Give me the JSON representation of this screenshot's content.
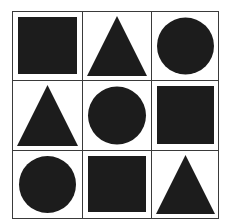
{
  "puzzle": {
    "rows": 3,
    "cols": 3,
    "fill_color": "#1c1c1c",
    "line_color": "#3a3a3a",
    "cells": [
      [
        "square",
        "triangle",
        "circle"
      ],
      [
        "triangle",
        "circle",
        "square"
      ],
      [
        "circle",
        "square",
        "triangle"
      ]
    ]
  }
}
